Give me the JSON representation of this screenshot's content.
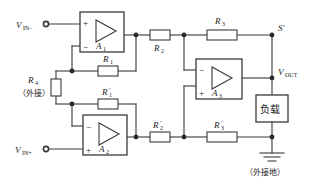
{
  "diagram": {
    "stroke_color": "#3a3a3a",
    "text_color": "#1a1a1a",
    "background": "#ffffff"
  },
  "terminals": {
    "vin_minus": "V",
    "vin_minus_sub": "IN−",
    "vin_plus": "V",
    "vin_plus_sub": "IN+",
    "vout": "V",
    "vout_sub": "OUT",
    "node_s": "S′"
  },
  "opamps": [
    {
      "id": "a1",
      "label": "A",
      "sub": "1",
      "top_input": "+",
      "bottom_input": "−"
    },
    {
      "id": "a2",
      "label": "A",
      "sub": "2",
      "top_input": "−",
      "bottom_input": "+"
    },
    {
      "id": "a3",
      "label": "A",
      "sub": "3",
      "top_input": "−",
      "bottom_input": "+"
    }
  ],
  "resistors": [
    {
      "id": "r1",
      "label": "R",
      "sub": "1",
      "prime": ""
    },
    {
      "id": "r1p",
      "label": "R",
      "sub": "1",
      "prime": "′"
    },
    {
      "id": "r2",
      "label": "R",
      "sub": "2",
      "prime": ""
    },
    {
      "id": "r2p",
      "label": "R",
      "sub": "2",
      "prime": "′"
    },
    {
      "id": "r3",
      "label": "R",
      "sub": "3",
      "prime": ""
    },
    {
      "id": "r3p",
      "label": "R",
      "sub": "3",
      "prime": "′"
    },
    {
      "id": "r4",
      "label": "R",
      "sub": "4",
      "prime": ""
    }
  ],
  "annotations": {
    "r4_note": "（外接）",
    "ground_note": "（外接地）",
    "load_label": "负载"
  }
}
